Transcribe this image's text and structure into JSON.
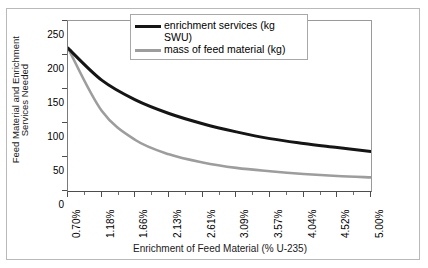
{
  "chart_data": {
    "type": "line",
    "title": "",
    "xlabel": "Enrichment of Feed Material (% U-235)",
    "ylabel": "Feed Material and Enrichment Services Needed",
    "ylabel_line1": "Feed Material and Enrichment",
    "ylabel_line2": "Services Needed",
    "ylim": [
      0,
      250
    ],
    "ytick_labels": [
      "250",
      "200",
      "150",
      "100",
      "50",
      "0"
    ],
    "ytick_values": [
      250,
      200,
      150,
      100,
      50,
      0
    ],
    "grid": false,
    "legend_position": "top-right-inside",
    "categories": [
      "0.70%",
      "1.18%",
      "1.66%",
      "2.13%",
      "2.61%",
      "3.09%",
      "3.57%",
      "4.04%",
      "4.52%",
      "5.00%"
    ],
    "x_numeric": [
      0.7,
      1.18,
      1.66,
      2.13,
      2.61,
      3.09,
      3.57,
      4.04,
      4.52,
      5.0
    ],
    "series": [
      {
        "name": "enrichment services (kg SWU)",
        "color": "#151515",
        "values": [
          210,
          163,
          134,
          114,
          99,
          87,
          77,
          70,
          64,
          58
        ]
      },
      {
        "name": "mass of feed material (kg)",
        "color": "#9d9d9d",
        "values": [
          210,
          118,
          75,
          54,
          42,
          34,
          29,
          25,
          22,
          20
        ]
      }
    ]
  },
  "legend": {
    "items": [
      {
        "label": "enrichment services (kg SWU)",
        "color": "#151515"
      },
      {
        "label": "mass of feed material (kg)",
        "color": "#9d9d9d"
      }
    ]
  }
}
